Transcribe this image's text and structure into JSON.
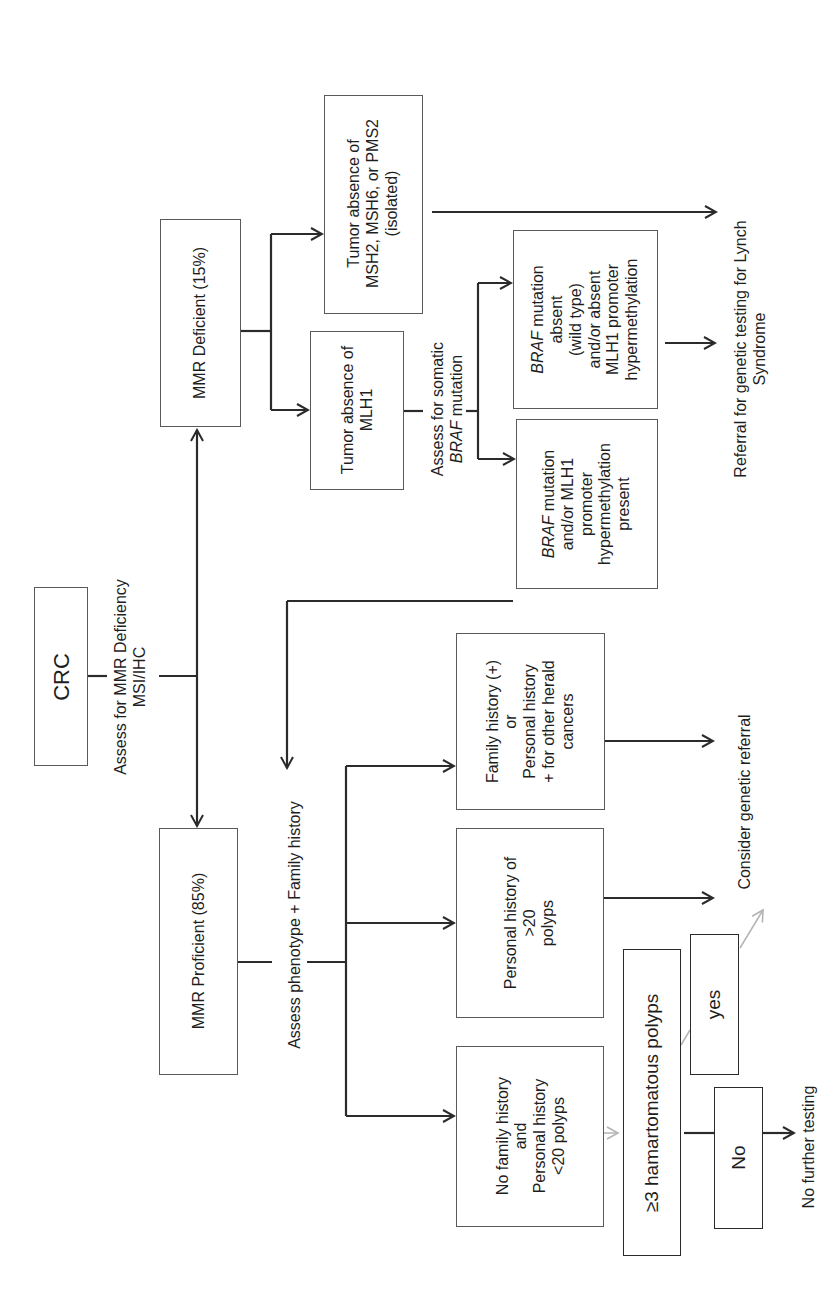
{
  "diagram": {
    "type": "flowchart",
    "orientation": "rotated 90deg counter-clockwise",
    "nodes": {
      "crc": "CRC",
      "assess_mmr": "Assess for MMR Deficiency\nMSI/IHC",
      "mmr_deficient": "MMR Deficient (15%)",
      "mmr_proficient": "MMR Proficient (85%)",
      "tumor_msh2": "Tumor absence of\nMSH2, MSH6, or PMS2\n(isolated)",
      "tumor_mlh1": "Tumor absence of\nMLH1",
      "assess_braf_line1": "Assess for somatic",
      "assess_braf_gene": "BRAF",
      "assess_braf_line2": " mutation",
      "braf_absent_gene": "BRAF",
      "braf_absent_text": " mutation\nabsent\n(wild type)\nand/or absent\nMLH1 promoter\nhypermethylation",
      "braf_present_gene": "BRAF",
      "braf_present_text": " mutation\nand/or MLH1\npromoter\nhypermethylation\npresent",
      "referral_lynch": "Referral for genetic testing for Lynch\nSyndrome",
      "assess_phenotype": "Assess phenotype + Family history",
      "family_history": "Family history (+)\nor\nPersonal history\n+ for other herald\ncancers",
      "personal_gt20": "Personal history of\n>20\npolyps",
      "no_family": "No family history\nand\nPersonal history\n<20 polyps",
      "consider_referral": "Consider genetic referral",
      "hamartomatous": "≥3 hamartomatous polyps",
      "yes": "yes",
      "no": "No",
      "no_further": "No further testing"
    },
    "edges": [
      {
        "from": "crc",
        "to": "assess_mmr"
      },
      {
        "from": "assess_mmr",
        "to": "mmr_deficient"
      },
      {
        "from": "assess_mmr",
        "to": "mmr_proficient"
      },
      {
        "from": "mmr_deficient",
        "to": "tumor_msh2"
      },
      {
        "from": "mmr_deficient",
        "to": "tumor_mlh1"
      },
      {
        "from": "tumor_msh2",
        "to": "referral_lynch"
      },
      {
        "from": "tumor_mlh1",
        "to": "assess_braf"
      },
      {
        "from": "assess_braf",
        "to": "braf_absent"
      },
      {
        "from": "assess_braf",
        "to": "braf_present"
      },
      {
        "from": "braf_absent",
        "to": "referral_lynch"
      },
      {
        "from": "braf_present",
        "to": "assess_phenotype"
      },
      {
        "from": "mmr_proficient",
        "to": "assess_phenotype"
      },
      {
        "from": "assess_phenotype",
        "to": "family_history"
      },
      {
        "from": "assess_phenotype",
        "to": "personal_gt20"
      },
      {
        "from": "assess_phenotype",
        "to": "no_family"
      },
      {
        "from": "family_history",
        "to": "consider_referral"
      },
      {
        "from": "personal_gt20",
        "to": "consider_referral"
      },
      {
        "from": "no_family",
        "to": "hamartomatous"
      },
      {
        "from": "hamartomatous",
        "to": "yes"
      },
      {
        "from": "yes",
        "to": "consider_referral"
      },
      {
        "from": "hamartomatous",
        "to": "no"
      },
      {
        "from": "no",
        "to": "no_further"
      }
    ],
    "colors": {
      "line": "#2b2b2b",
      "box_border": "#5a5a5a",
      "gray_arrow": "#b4b4b4",
      "background": "#ffffff"
    }
  }
}
